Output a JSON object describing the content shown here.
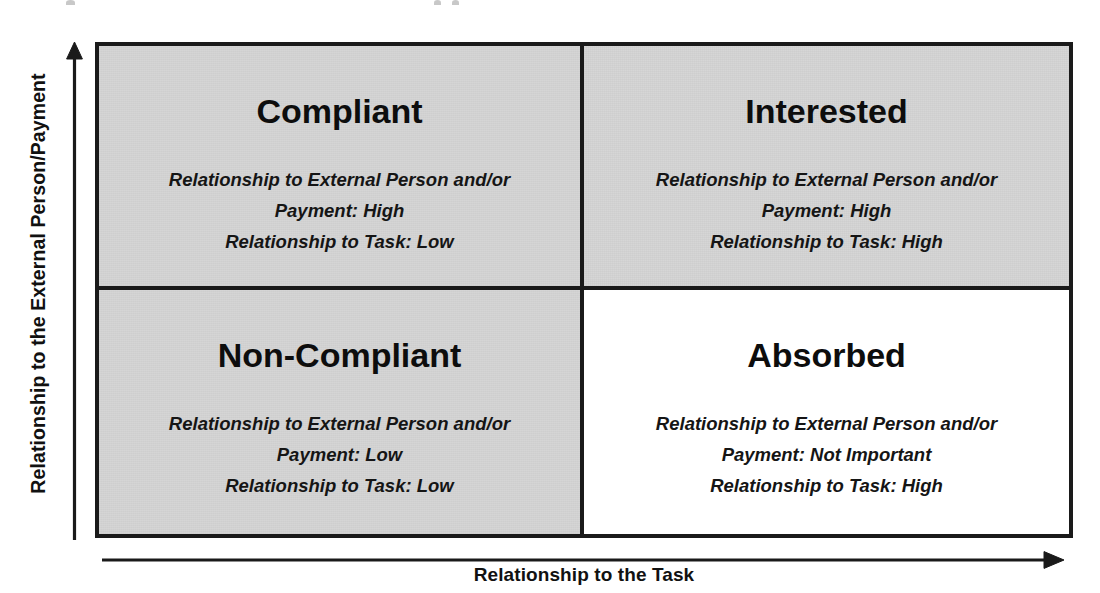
{
  "diagram": {
    "type": "2x2-matrix",
    "axes": {
      "y_label": "Relationship to the External Person/Payment",
      "x_label": "Relationship to the Task",
      "y_arrow_icon": "arrow-up-icon",
      "x_arrow_icon": "arrow-right-icon"
    },
    "colors": {
      "shaded_fill": "#d5d5d5",
      "plain_fill": "#ffffff",
      "border": "#1a1a1a",
      "text": "#111111"
    },
    "quadrants": [
      {
        "id": "compliant",
        "position": "top-left",
        "title": "Compliant",
        "shaded": true,
        "lines": [
          "Relationship to External Person and/or",
          "Payment: High",
          "Relationship to Task: Low"
        ],
        "external_person_payment": "High",
        "task": "Low"
      },
      {
        "id": "interested",
        "position": "top-right",
        "title": "Interested",
        "shaded": true,
        "lines": [
          "Relationship to External Person and/or",
          "Payment: High",
          "Relationship to Task: High"
        ],
        "external_person_payment": "High",
        "task": "High"
      },
      {
        "id": "non-compliant",
        "position": "bottom-left",
        "title": "Non-Compliant",
        "shaded": true,
        "lines": [
          "Relationship to External Person and/or",
          "Payment: Low",
          "Relationship to Task: Low"
        ],
        "external_person_payment": "Low",
        "task": "Low"
      },
      {
        "id": "absorbed",
        "position": "bottom-right",
        "title": "Absorbed",
        "shaded": false,
        "lines": [
          "Relationship to External Person and/or",
          "Payment: Not Important",
          "Relationship to Task: High"
        ],
        "external_person_payment": "Not Important",
        "task": "High"
      }
    ]
  }
}
